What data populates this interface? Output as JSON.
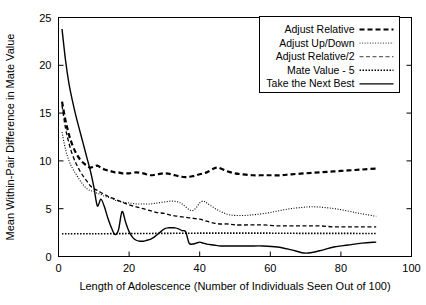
{
  "chart_data": {
    "type": "line",
    "title": "",
    "xlabel": "Length of Adolescence (Number of Individuals Seen Out of 100)",
    "ylabel": "Mean Within-Pair Difference in Mate Value",
    "xlim": [
      0,
      100
    ],
    "ylim": [
      0,
      25
    ],
    "xticks": [
      0,
      20,
      40,
      60,
      80,
      100
    ],
    "xtick_labels": [
      "0",
      "20",
      "40",
      "60",
      "80",
      "100"
    ],
    "yticks": [
      0,
      5,
      10,
      15,
      20,
      25
    ],
    "ytick_labels": [
      "0",
      "5",
      "10",
      "15",
      "20",
      "25"
    ],
    "grid": false,
    "legend_position": "top-right",
    "legend_entries": [
      "Adjust Relative",
      "Adjust Up/Down",
      "Adjust Relative/2",
      "Mate Value - 5",
      "Take the Next Best"
    ],
    "series": [
      {
        "name": "Adjust Relative",
        "style": "thick-dashed",
        "color": "#000000",
        "stroke_width": 2.2,
        "dash": "5,3",
        "x": [
          1,
          2,
          3,
          4,
          5,
          6,
          7,
          8,
          9,
          10,
          11,
          12,
          13,
          14,
          15,
          16,
          17,
          18,
          19,
          20,
          22,
          24,
          26,
          28,
          30,
          32,
          34,
          36,
          38,
          40,
          42,
          44,
          45,
          46,
          48,
          50,
          52,
          55,
          58,
          60,
          63,
          66,
          70,
          74,
          78,
          82,
          86,
          90
        ],
        "y": [
          16.2,
          14.2,
          12.7,
          11.6,
          10.8,
          10.2,
          9.8,
          9.5,
          9.3,
          9.4,
          9.5,
          9.3,
          9.1,
          9.0,
          8.9,
          8.8,
          8.8,
          8.7,
          8.7,
          8.7,
          8.8,
          8.7,
          8.5,
          8.6,
          8.7,
          8.6,
          8.4,
          8.3,
          8.4,
          8.6,
          8.8,
          9.2,
          9.3,
          9.2,
          8.9,
          8.7,
          8.6,
          8.5,
          8.5,
          8.5,
          8.5,
          8.6,
          8.7,
          8.8,
          8.9,
          9.0,
          9.1,
          9.2
        ]
      },
      {
        "name": "Adjust Up/Down",
        "style": "fine-dotted",
        "color": "#555555",
        "stroke_width": 1.1,
        "dash": "1,1.6",
        "x": [
          1,
          2,
          3,
          4,
          5,
          6,
          7,
          8,
          9,
          10,
          11,
          12,
          13,
          14,
          15,
          16,
          18,
          20,
          22,
          24,
          26,
          28,
          30,
          32,
          34,
          35,
          36,
          37,
          38,
          39,
          40,
          41,
          42,
          44,
          46,
          48,
          50,
          53,
          56,
          60,
          64,
          68,
          72,
          76,
          80,
          84,
          87,
          90
        ],
        "y": [
          13.0,
          11.2,
          10.0,
          9.2,
          8.6,
          8.0,
          7.5,
          7.1,
          6.9,
          6.8,
          6.6,
          6.5,
          6.3,
          6.2,
          6.1,
          5.9,
          5.7,
          5.6,
          5.5,
          5.5,
          5.5,
          5.6,
          5.7,
          5.8,
          5.7,
          5.5,
          5.2,
          4.9,
          4.8,
          5.1,
          5.6,
          5.8,
          5.6,
          5.1,
          4.7,
          4.4,
          4.3,
          4.3,
          4.4,
          4.6,
          4.9,
          5.1,
          5.2,
          5.1,
          4.9,
          4.6,
          4.4,
          4.2
        ]
      },
      {
        "name": "Adjust Relative/2",
        "style": "medium-dashed",
        "color": "#666666",
        "stroke_width": 1.3,
        "dash": "4,2.5",
        "x": [
          1,
          2,
          3,
          4,
          5,
          6,
          7,
          8,
          9,
          10,
          11,
          12,
          14,
          16,
          18,
          20,
          22,
          24,
          26,
          28,
          30,
          32,
          34,
          36,
          38,
          40,
          42,
          44,
          46,
          48,
          50,
          54,
          58,
          62,
          66,
          70,
          74,
          78,
          82,
          86,
          90
        ],
        "y": [
          15.8,
          13.4,
          11.8,
          10.6,
          9.7,
          9.0,
          8.4,
          7.9,
          7.4,
          7.1,
          6.9,
          6.7,
          6.3,
          6.0,
          5.7,
          5.4,
          5.2,
          5.0,
          4.8,
          4.6,
          4.5,
          4.3,
          4.2,
          4.1,
          4.0,
          3.9,
          3.7,
          3.5,
          3.4,
          3.4,
          3.3,
          3.3,
          3.3,
          3.2,
          3.2,
          3.2,
          3.2,
          3.1,
          3.1,
          3.1,
          3.1
        ]
      },
      {
        "name": "Mate Value - 5",
        "style": "dense-dotted",
        "color": "#000000",
        "stroke_width": 1.6,
        "dash": "1.5,1.5",
        "x": [
          1,
          10,
          20,
          30,
          40,
          50,
          60,
          70,
          80,
          90
        ],
        "y": [
          2.38,
          2.38,
          2.4,
          2.42,
          2.44,
          2.44,
          2.44,
          2.42,
          2.42,
          2.4
        ]
      },
      {
        "name": "Take the Next Best",
        "style": "solid",
        "color": "#000000",
        "stroke_width": 1.4,
        "dash": "none",
        "x": [
          1,
          2,
          3,
          4,
          5,
          6,
          7,
          8,
          9,
          10,
          11,
          12,
          13,
          14,
          15,
          16,
          17,
          18,
          19,
          20,
          21,
          22,
          23,
          24,
          25,
          26,
          27,
          28,
          29,
          30,
          31,
          32,
          33,
          34,
          35,
          36,
          37,
          38,
          39,
          40,
          41,
          42,
          44,
          46,
          48,
          50,
          54,
          58,
          62,
          66,
          70,
          74,
          78,
          82,
          86,
          90
        ],
        "y": [
          23.8,
          20.5,
          18.0,
          16.2,
          14.6,
          13.2,
          11.8,
          10.4,
          9.0,
          7.3,
          5.3,
          6.0,
          5.2,
          4.0,
          3.0,
          2.3,
          2.8,
          4.7,
          3.6,
          2.6,
          2.0,
          1.7,
          1.6,
          1.6,
          1.7,
          1.8,
          2.0,
          2.3,
          2.6,
          2.9,
          3.0,
          3.0,
          3.0,
          2.9,
          2.7,
          2.6,
          1.4,
          1.3,
          1.4,
          1.5,
          1.4,
          1.3,
          1.2,
          1.1,
          1.1,
          1.1,
          1.1,
          1.1,
          1.0,
          0.7,
          0.35,
          0.6,
          1.0,
          1.2,
          1.4,
          1.5
        ]
      }
    ]
  }
}
